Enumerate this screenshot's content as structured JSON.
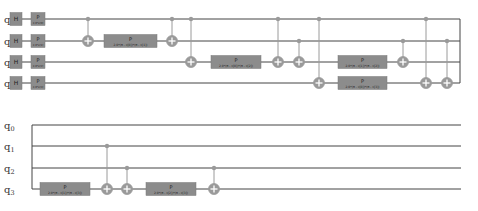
{
  "diagram": {
    "type": "quantum-circuit",
    "colors": {
      "wire": "#444444",
      "gate_fill": "#8c8c8c",
      "gate_stroke": "#7a7a7a",
      "gate_text": "#222222",
      "control": "#9a9a9a",
      "target_fill": "#9a9a9a",
      "target_symbol": "#ffffff",
      "background": "#ffffff"
    },
    "qubits": [
      "q0",
      "q1",
      "q2",
      "q3"
    ],
    "qubit_labels": [
      {
        "base": "q",
        "sub": "0"
      },
      {
        "base": "q",
        "sub": "1"
      },
      {
        "base": "q",
        "sub": "2"
      },
      {
        "base": "q",
        "sub": "3"
      }
    ],
    "blocks": [
      {
        "id": "block-1",
        "wire_y": [
          19,
          41,
          62,
          83
        ],
        "wire_x_start": 30,
        "wire_x_end": 460,
        "end_barrier": true,
        "start_barrier": false,
        "gates": [
          {
            "type": "H",
            "label": "H",
            "qubit": 0,
            "x": 10,
            "w": 12
          },
          {
            "type": "H",
            "label": "H",
            "qubit": 1,
            "x": 10,
            "w": 12
          },
          {
            "type": "H",
            "label": "H",
            "qubit": 2,
            "x": 10,
            "w": 12
          },
          {
            "type": "H",
            "label": "H",
            "qubit": 3,
            "x": 10,
            "w": 12
          },
          {
            "type": "P",
            "label": "P",
            "param": "2.0*x[0]",
            "qubit": 0,
            "x": 31,
            "w": 14
          },
          {
            "type": "P",
            "label": "P",
            "param": "2.0*x[1]",
            "qubit": 1,
            "x": 31,
            "w": 14
          },
          {
            "type": "P",
            "label": "P",
            "param": "2.0*x[2]",
            "qubit": 2,
            "x": 31,
            "w": 14
          },
          {
            "type": "P",
            "label": "P",
            "param": "2.0*x[3]",
            "qubit": 3,
            "x": 31,
            "w": 14
          },
          {
            "type": "CX",
            "control": 0,
            "target": 1,
            "x": 88
          },
          {
            "type": "P",
            "label": "P",
            "param": "2.0*(π - x[0])*(π - x[1])",
            "qubit": 1,
            "x": 104,
            "w": 53
          },
          {
            "type": "CX",
            "control": 0,
            "target": 1,
            "x": 172
          },
          {
            "type": "CX",
            "control": 0,
            "target": 2,
            "x": 191
          },
          {
            "type": "P",
            "label": "P",
            "param": "2.0*(π - x[0])*(π - x[2])",
            "qubit": 2,
            "x": 211,
            "w": 50
          },
          {
            "type": "CX",
            "control": 0,
            "target": 2,
            "x": 278
          },
          {
            "type": "CX",
            "control": 1,
            "target": 2,
            "x": 299
          },
          {
            "type": "CX",
            "control": 0,
            "target": 3,
            "x": 319
          },
          {
            "type": "P",
            "label": "P",
            "param": "2.0*(π - x[1])*(π - x[2])",
            "qubit": 2,
            "x": 338,
            "w": 49
          },
          {
            "type": "P",
            "label": "P",
            "param": "2.0*(π - x[0])*(π - x[3])",
            "qubit": 3,
            "x": 338,
            "w": 49
          },
          {
            "type": "CX",
            "control": 1,
            "target": 2,
            "x": 403
          },
          {
            "type": "CX",
            "control": 0,
            "target": 3,
            "x": 426
          },
          {
            "type": "CX",
            "control": 1,
            "target": 3,
            "x": 447
          }
        ]
      },
      {
        "id": "block-2",
        "wire_y": [
          125,
          146,
          168,
          189
        ],
        "wire_x_start": 32,
        "wire_x_end": 461,
        "end_barrier": false,
        "start_barrier": true,
        "gates": [
          {
            "type": "P",
            "label": "P",
            "param": "2.0*(π - x[1])*(π - x[3])",
            "qubit": 3,
            "x": 40,
            "w": 50
          },
          {
            "type": "CX",
            "control": 1,
            "target": 3,
            "x": 107
          },
          {
            "type": "CX",
            "control": 2,
            "target": 3,
            "x": 127
          },
          {
            "type": "P",
            "label": "P",
            "param": "2.0*(π - x[2])*(π - x[3])",
            "qubit": 3,
            "x": 146,
            "w": 50
          },
          {
            "type": "CX",
            "control": 2,
            "target": 3,
            "x": 214
          }
        ]
      }
    ]
  }
}
